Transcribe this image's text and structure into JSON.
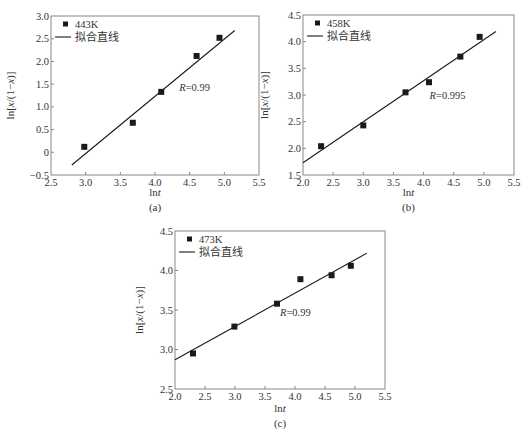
{
  "chart_data": [
    {
      "type": "scatter",
      "panel_label": "(a)",
      "title": "",
      "xlabel": "lnt",
      "ylabel": "ln[x/(1−x)]",
      "xlim": [
        2.5,
        5.5
      ],
      "ylim": [
        -0.5,
        3.0
      ],
      "xticks": [
        "2.5",
        "3.0",
        "3.5",
        "4.0",
        "4.5",
        "5.0",
        "5.5"
      ],
      "yticks": [
        "−0.5",
        "0",
        "0.5",
        "1.0",
        "1.5",
        "2.0",
        "2.5",
        "3.0"
      ],
      "grid": false,
      "legend": {
        "position": "upper-left",
        "entries": [
          "443K",
          "拟合直线"
        ]
      },
      "series": [
        {
          "name": "443K",
          "kind": "scatter",
          "marker": "square",
          "x": [
            2.98,
            3.68,
            4.09,
            4.6,
            4.93
          ],
          "y": [
            0.12,
            0.65,
            1.33,
            2.12,
            2.52
          ]
        },
        {
          "name": "拟合直线",
          "kind": "line",
          "x": [
            2.8,
            5.15
          ],
          "y": [
            -0.28,
            2.68
          ]
        }
      ],
      "annotation": {
        "text": "R=0.99",
        "x": 4.35,
        "y": 1.35
      }
    },
    {
      "type": "scatter",
      "panel_label": "(b)",
      "title": "",
      "xlabel": "lnt",
      "ylabel": "ln[x/(1−x)]",
      "xlim": [
        2.0,
        5.5
      ],
      "ylim": [
        1.5,
        4.5
      ],
      "xticks": [
        "2.0",
        "2.5",
        "3.0",
        "3.5",
        "4.0",
        "4.5",
        "5.0",
        "5.5"
      ],
      "yticks": [
        "1.5",
        "2.0",
        "2.5",
        "3.0",
        "3.5",
        "4.0",
        "4.5"
      ],
      "grid": false,
      "legend": {
        "position": "upper-left",
        "entries": [
          "458K",
          "拟合直线"
        ]
      },
      "series": [
        {
          "name": "458K",
          "kind": "scatter",
          "marker": "square",
          "x": [
            2.3,
            3.0,
            3.7,
            4.09,
            4.61,
            4.93
          ],
          "y": [
            2.04,
            2.43,
            3.05,
            3.24,
            3.72,
            4.09
          ]
        },
        {
          "name": "拟合直线",
          "kind": "line",
          "x": [
            2.0,
            5.2
          ],
          "y": [
            1.73,
            4.19
          ]
        }
      ],
      "annotation": {
        "text": "R=0.995",
        "x": 4.1,
        "y": 2.92
      }
    },
    {
      "type": "scatter",
      "panel_label": "(c)",
      "title": "",
      "xlabel": "lnt",
      "ylabel": "ln[x/(1−x)]",
      "xlim": [
        2.0,
        5.5
      ],
      "ylim": [
        2.5,
        4.5
      ],
      "xticks": [
        "2.0",
        "2.5",
        "3.0",
        "3.5",
        "4.0",
        "4.5",
        "5.0",
        "5.5"
      ],
      "yticks": [
        "2.5",
        "3.0",
        "3.5",
        "4.0",
        "4.5"
      ],
      "grid": false,
      "legend": {
        "position": "upper-left",
        "entries": [
          "473K",
          "拟合直线"
        ]
      },
      "series": [
        {
          "name": "473K",
          "kind": "scatter",
          "marker": "square",
          "x": [
            2.3,
            2.99,
            3.7,
            4.09,
            4.61,
            4.93
          ],
          "y": [
            2.95,
            3.29,
            3.58,
            3.89,
            3.94,
            4.06
          ]
        },
        {
          "name": "拟合直线",
          "kind": "line",
          "x": [
            2.0,
            5.2
          ],
          "y": [
            2.87,
            4.22
          ]
        }
      ],
      "annotation": {
        "text": "R=0.99",
        "x": 3.75,
        "y": 3.42
      }
    }
  ],
  "panels": [
    {
      "box": {
        "left": 51,
        "top": 16,
        "right": 259,
        "bottom": 175
      },
      "ylabel_x": 14,
      "xlabel_y": 196,
      "caption_y": 205
    },
    {
      "box": {
        "left": 303,
        "top": 15,
        "right": 514,
        "bottom": 175
      },
      "ylabel_x": 268,
      "xlabel_y": 196,
      "caption_y": 205
    },
    {
      "box": {
        "left": 175,
        "top": 231,
        "right": 385,
        "bottom": 389
      },
      "ylabel_x": 143,
      "xlabel_y": 412,
      "caption_y": 421
    }
  ],
  "style": {
    "axis_color": "#888888",
    "ink": "#1a1a1a",
    "text_color": "#333333"
  }
}
